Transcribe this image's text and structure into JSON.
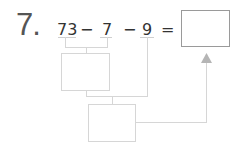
{
  "problem": {
    "number": "7.",
    "terms": [
      "73",
      "7",
      "9"
    ],
    "operators": [
      "−",
      "−"
    ],
    "equals": "=",
    "answer": ""
  },
  "diagram": {
    "step1_box": "",
    "step2_box": "",
    "arrow": "arrow-up-icon"
  }
}
